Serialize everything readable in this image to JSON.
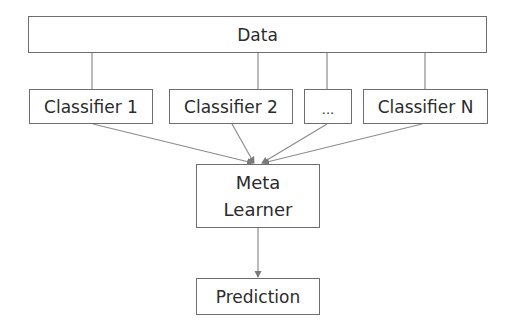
{
  "diagram": {
    "nodes": {
      "data": {
        "label": "Data"
      },
      "classifiers": [
        {
          "label": "Classifier 1"
        },
        {
          "label": "Classifier 2"
        },
        {
          "label": "..."
        },
        {
          "label": "Classifier N"
        }
      ],
      "meta_learner": {
        "label_line1": "Meta",
        "label_line2": "Learner"
      },
      "prediction": {
        "label": "Prediction"
      }
    },
    "edges": [
      {
        "from": "Data",
        "to": "Classifier 1",
        "style": "line"
      },
      {
        "from": "Data",
        "to": "Classifier 2",
        "style": "line"
      },
      {
        "from": "Data",
        "to": "...",
        "style": "line"
      },
      {
        "from": "Data",
        "to": "Classifier N",
        "style": "line"
      },
      {
        "from": "Classifier 1",
        "to": "Meta Learner",
        "style": "arrow"
      },
      {
        "from": "Classifier 2",
        "to": "Meta Learner",
        "style": "arrow"
      },
      {
        "from": "...",
        "to": "Meta Learner",
        "style": "arrow"
      },
      {
        "from": "Classifier N",
        "to": "Meta Learner",
        "style": "arrow"
      },
      {
        "from": "Meta Learner",
        "to": "Prediction",
        "style": "arrow"
      }
    ],
    "colors": {
      "border": "#6e6e6e",
      "line": "#8c8c8c",
      "text": "#2b2b2b",
      "background": "#ffffff"
    }
  }
}
